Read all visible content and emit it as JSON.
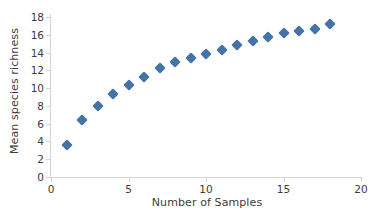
{
  "chart_data": {
    "type": "scatter",
    "title": "",
    "xlabel": "Number of Samples",
    "ylabel": "Mean species richness",
    "xlim": [
      0,
      20
    ],
    "ylim": [
      0,
      18
    ],
    "xticks": [
      0,
      5,
      10,
      15,
      20
    ],
    "yticks": [
      0,
      2,
      4,
      6,
      8,
      10,
      12,
      14,
      16,
      18
    ],
    "grid": false,
    "legend": null,
    "marker_shape": "diamond",
    "marker_color": "#4572A7",
    "x": [
      1,
      2,
      3,
      4,
      5,
      6,
      7,
      8,
      9,
      10,
      11,
      12,
      13,
      14,
      15,
      16,
      17,
      18
    ],
    "values": [
      3.6,
      6.4,
      8.0,
      9.35,
      10.4,
      11.25,
      12.25,
      12.9,
      13.4,
      13.85,
      14.3,
      14.8,
      15.35,
      15.7,
      16.15,
      16.4,
      16.7,
      17.2
    ],
    "series": [
      {
        "name": "Mean species richness",
        "values": [
          3.6,
          6.4,
          8.0,
          9.35,
          10.4,
          11.25,
          12.25,
          12.9,
          13.4,
          13.85,
          14.3,
          14.8,
          15.35,
          15.7,
          16.15,
          16.4,
          16.7,
          17.2
        ]
      }
    ]
  },
  "axes": {
    "y_tick_labels": [
      "0",
      "2",
      "4",
      "6",
      "8",
      "10",
      "12",
      "14",
      "16",
      "18"
    ],
    "x_tick_labels": [
      "0",
      "5",
      "10",
      "15",
      "20"
    ]
  }
}
